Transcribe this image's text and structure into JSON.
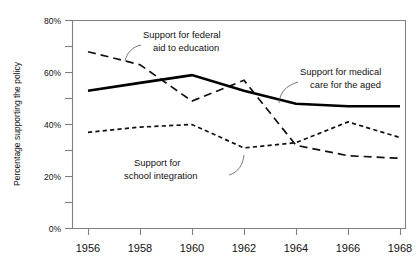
{
  "chart_data": {
    "type": "line",
    "title": "",
    "xlabel": "",
    "ylabel": "Percentage supporting the policy",
    "x": [
      1956,
      1958,
      1960,
      1962,
      1964,
      1966,
      1968
    ],
    "xtick_labels": [
      "1956",
      "1958",
      "1960",
      "1962",
      "1964",
      "1966",
      "1968"
    ],
    "ytick_labels": [
      "0%",
      "20%",
      "40%",
      "60%",
      "80%"
    ],
    "ytick_values": [
      0,
      20,
      40,
      60,
      80
    ],
    "yminor_values": [
      10,
      30,
      50,
      70
    ],
    "ylim": [
      0,
      80
    ],
    "xlim": [
      1955,
      1968.5
    ],
    "grid": false,
    "legend": "annotations",
    "series": [
      {
        "name": "Support for federal aid to education",
        "style": "long-dash",
        "values": [
          68,
          63,
          49,
          57,
          32,
          28,
          27
        ]
      },
      {
        "name": "Support for medical care for the aged",
        "style": "solid",
        "values": [
          53,
          56,
          59,
          53,
          48,
          47,
          47
        ]
      },
      {
        "name": "Support for school integration",
        "style": "short-dash",
        "values": [
          37,
          39,
          40,
          31,
          33,
          41,
          35
        ]
      }
    ],
    "annotations": [
      {
        "id": "annot-federal-aid",
        "lines": [
          "Support for federal",
          "aid to education"
        ],
        "target_series": "Support for federal aid to education"
      },
      {
        "id": "annot-medical-care",
        "lines": [
          "Support for medical",
          "care for the aged"
        ],
        "target_series": "Support for medical care for the aged"
      },
      {
        "id": "annot-school-integration",
        "lines": [
          "Support for",
          "school integration"
        ],
        "target_series": "Support for school integration"
      }
    ]
  }
}
